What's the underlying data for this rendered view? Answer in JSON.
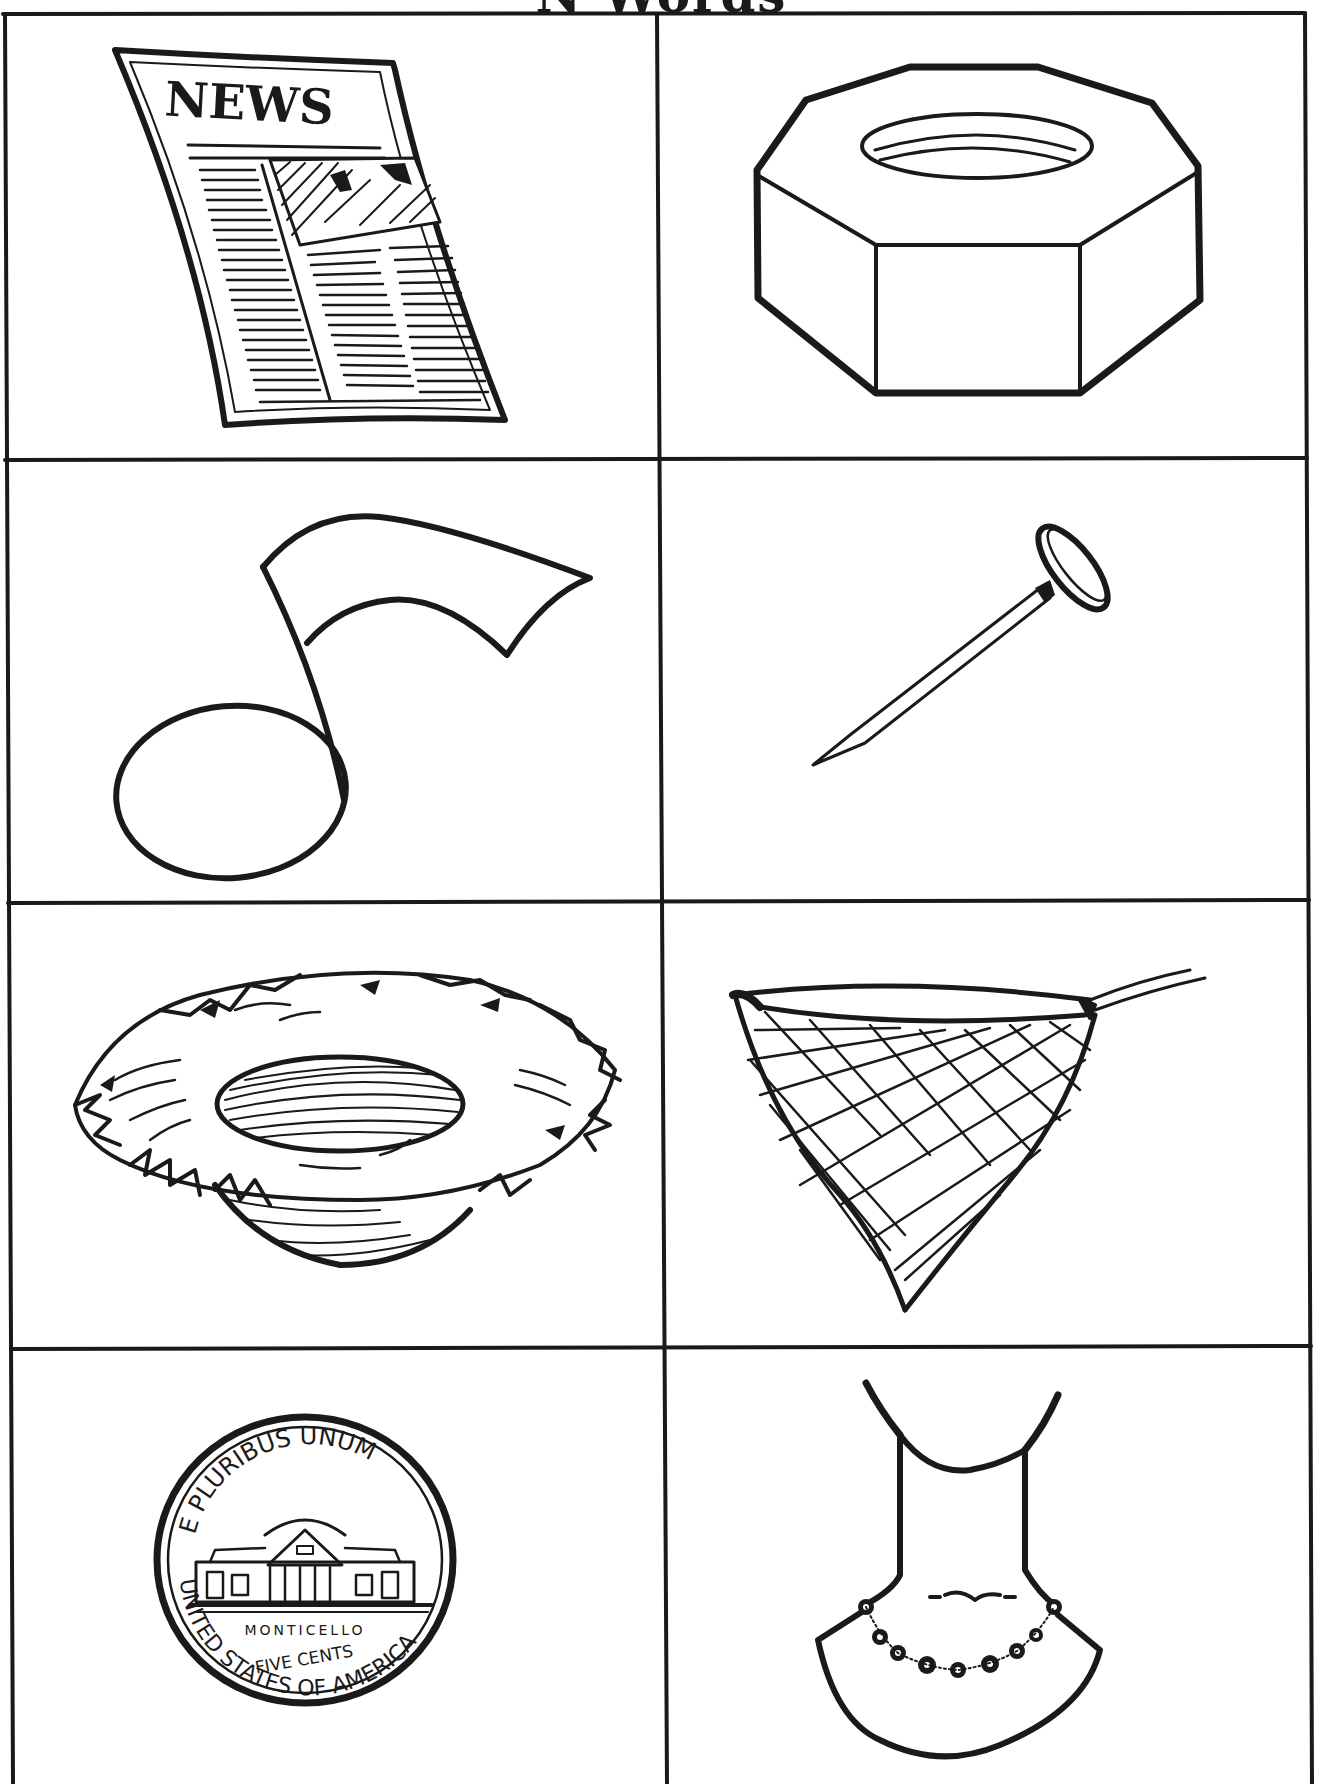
{
  "worksheet": {
    "title": "N Words",
    "colors": {
      "ink": "#1a1a1a",
      "paper": "#ffffff"
    },
    "grid": {
      "rows": 4,
      "cols": 2
    },
    "cells": [
      {
        "row": 1,
        "col": 1,
        "picture": "newspaper",
        "visible_text": "NEWS"
      },
      {
        "row": 1,
        "col": 2,
        "picture": "nut"
      },
      {
        "row": 2,
        "col": 1,
        "picture": "note"
      },
      {
        "row": 2,
        "col": 2,
        "picture": "nail"
      },
      {
        "row": 3,
        "col": 1,
        "picture": "nest"
      },
      {
        "row": 3,
        "col": 2,
        "picture": "net"
      },
      {
        "row": 4,
        "col": 1,
        "picture": "nickel",
        "coin_text": {
          "top": "E PLURIBUS UNUM",
          "building": "MONTICELLO",
          "value": "FIVE CENTS",
          "rim": "UNITED STATES OF AMERICA"
        }
      },
      {
        "row": 4,
        "col": 2,
        "picture": "necklace"
      }
    ]
  }
}
